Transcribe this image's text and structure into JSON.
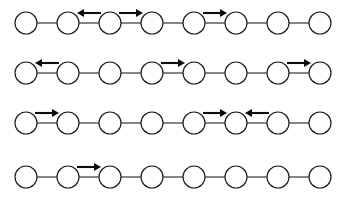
{
  "figure": {
    "title": "",
    "type": "node-chain-diagram",
    "background_color": "#ffffff",
    "node_color": "#ffffff",
    "node_stroke_color": "#1a1a1a",
    "edge_color": "#2b2b2b",
    "arrow_color": "#0d0d0d",
    "width": 341,
    "height": 205,
    "node_radius": 11,
    "nodes_per_row": 8,
    "row_count": 4
  },
  "rows": [
    {
      "index": 0,
      "name": "chain-row-1",
      "center_y": 23,
      "node_xs": [
        26,
        68,
        110,
        152,
        194,
        236,
        278,
        320
      ],
      "nodes": [
        {
          "id": "r1n1",
          "label": ""
        },
        {
          "id": "r1n2",
          "label": ""
        },
        {
          "id": "r1n3",
          "label": ""
        },
        {
          "id": "r1n4",
          "label": ""
        },
        {
          "id": "r1n5",
          "label": ""
        },
        {
          "id": "r1n6",
          "label": ""
        },
        {
          "id": "r1n7",
          "label": ""
        },
        {
          "id": "r1n8",
          "label": ""
        }
      ],
      "edges": [
        {
          "from": 0,
          "to": 1,
          "arrow": "none"
        },
        {
          "from": 1,
          "to": 2,
          "arrow": "left"
        },
        {
          "from": 2,
          "to": 3,
          "arrow": "right"
        },
        {
          "from": 3,
          "to": 4,
          "arrow": "none"
        },
        {
          "from": 4,
          "to": 5,
          "arrow": "right"
        },
        {
          "from": 5,
          "to": 6,
          "arrow": "none"
        },
        {
          "from": 6,
          "to": 7,
          "arrow": "none"
        }
      ]
    },
    {
      "index": 1,
      "name": "chain-row-2",
      "center_y": 73,
      "node_xs": [
        26,
        68,
        110,
        152,
        194,
        236,
        278,
        320
      ],
      "nodes": [
        {
          "id": "r2n1",
          "label": ""
        },
        {
          "id": "r2n2",
          "label": ""
        },
        {
          "id": "r2n3",
          "label": ""
        },
        {
          "id": "r2n4",
          "label": ""
        },
        {
          "id": "r2n5",
          "label": ""
        },
        {
          "id": "r2n6",
          "label": ""
        },
        {
          "id": "r2n7",
          "label": ""
        },
        {
          "id": "r2n8",
          "label": ""
        }
      ],
      "edges": [
        {
          "from": 0,
          "to": 1,
          "arrow": "left"
        },
        {
          "from": 1,
          "to": 2,
          "arrow": "none"
        },
        {
          "from": 2,
          "to": 3,
          "arrow": "none"
        },
        {
          "from": 3,
          "to": 4,
          "arrow": "right"
        },
        {
          "from": 4,
          "to": 5,
          "arrow": "none"
        },
        {
          "from": 5,
          "to": 6,
          "arrow": "none"
        },
        {
          "from": 6,
          "to": 7,
          "arrow": "right"
        }
      ]
    },
    {
      "index": 2,
      "name": "chain-row-3",
      "center_y": 123,
      "node_xs": [
        26,
        68,
        110,
        152,
        194,
        236,
        278,
        320
      ],
      "nodes": [
        {
          "id": "r3n1",
          "label": ""
        },
        {
          "id": "r3n2",
          "label": ""
        },
        {
          "id": "r3n3",
          "label": ""
        },
        {
          "id": "r3n4",
          "label": ""
        },
        {
          "id": "r3n5",
          "label": ""
        },
        {
          "id": "r3n6",
          "label": ""
        },
        {
          "id": "r3n7",
          "label": ""
        },
        {
          "id": "r3n8",
          "label": ""
        }
      ],
      "edges": [
        {
          "from": 0,
          "to": 1,
          "arrow": "right"
        },
        {
          "from": 1,
          "to": 2,
          "arrow": "none"
        },
        {
          "from": 2,
          "to": 3,
          "arrow": "none"
        },
        {
          "from": 3,
          "to": 4,
          "arrow": "none"
        },
        {
          "from": 4,
          "to": 5,
          "arrow": "right"
        },
        {
          "from": 5,
          "to": 6,
          "arrow": "left"
        },
        {
          "from": 6,
          "to": 7,
          "arrow": "none"
        }
      ]
    },
    {
      "index": 3,
      "name": "chain-row-4",
      "center_y": 177,
      "node_xs": [
        26,
        68,
        110,
        152,
        194,
        236,
        278,
        320
      ],
      "nodes": [
        {
          "id": "r4n1",
          "label": ""
        },
        {
          "id": "r4n2",
          "label": ""
        },
        {
          "id": "r4n3",
          "label": ""
        },
        {
          "id": "r4n4",
          "label": ""
        },
        {
          "id": "r4n5",
          "label": ""
        },
        {
          "id": "r4n6",
          "label": ""
        },
        {
          "id": "r4n7",
          "label": ""
        },
        {
          "id": "r4n8",
          "label": ""
        }
      ],
      "edges": [
        {
          "from": 0,
          "to": 1,
          "arrow": "none"
        },
        {
          "from": 1,
          "to": 2,
          "arrow": "right"
        },
        {
          "from": 2,
          "to": 3,
          "arrow": "none"
        },
        {
          "from": 3,
          "to": 4,
          "arrow": "none"
        },
        {
          "from": 4,
          "to": 5,
          "arrow": "none"
        },
        {
          "from": 5,
          "to": 6,
          "arrow": "none"
        },
        {
          "from": 6,
          "to": 7,
          "arrow": "none"
        }
      ]
    }
  ]
}
